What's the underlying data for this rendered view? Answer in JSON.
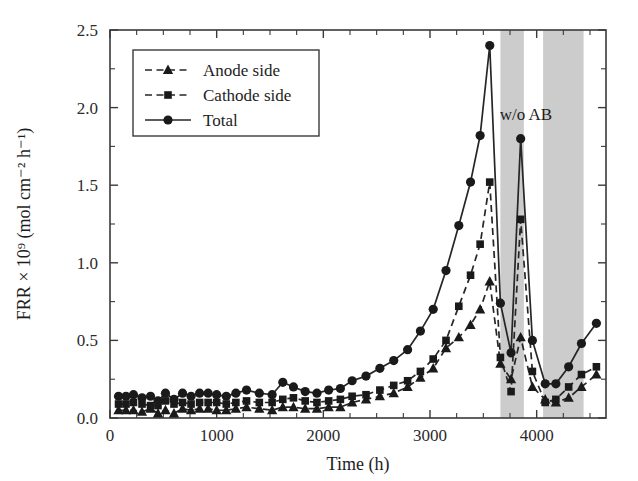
{
  "chart_data": {
    "type": "line",
    "title": "",
    "xlabel": "Time (h)",
    "ylabel": "FRR × 10⁹ (mol cm⁻² h⁻¹)",
    "xlim": [
      0,
      4650
    ],
    "ylim": [
      0.0,
      2.5
    ],
    "grid": false,
    "legend_position": "upper-left",
    "xticks": [
      0,
      1000,
      2000,
      3000,
      4000
    ],
    "xticklabels": [
      "0",
      "1000",
      "2000",
      "3000",
      "4000"
    ],
    "xticks_minor_step": 250,
    "yticks": [
      0.0,
      0.5,
      1.0,
      1.5,
      2.0,
      2.5
    ],
    "yticklabels": [
      "0.0",
      "0.5",
      "1.0",
      "1.5",
      "2.0",
      "2.5"
    ],
    "yticks_minor_step": 0.25,
    "annotations": [
      {
        "text": "w/o AB",
        "x": 3900,
        "y": 1.92
      }
    ],
    "shaded_bands": [
      {
        "x0": 3660,
        "x1": 3880,
        "color": "#c9c9c9"
      },
      {
        "x0": 4060,
        "x1": 4440,
        "color": "#c9c9c9"
      }
    ],
    "series": [
      {
        "name": "Anode side",
        "marker": "triangle",
        "linestyle": "dashed",
        "color": "#1a1a1a",
        "x": [
          80,
          150,
          220,
          300,
          380,
          450,
          520,
          600,
          680,
          760,
          840,
          920,
          1000,
          1090,
          1180,
          1280,
          1400,
          1520,
          1620,
          1720,
          1830,
          1940,
          2050,
          2160,
          2270,
          2400,
          2530,
          2660,
          2790,
          2910,
          3030,
          3150,
          3270,
          3380,
          3470,
          3560,
          3660,
          3760,
          3850,
          3960,
          4080,
          4180,
          4300,
          4420,
          4560
        ],
        "y": [
          0.05,
          0.05,
          0.05,
          0.04,
          0.06,
          0.03,
          0.05,
          0.03,
          0.06,
          0.05,
          0.06,
          0.06,
          0.05,
          0.05,
          0.06,
          0.07,
          0.06,
          0.05,
          0.07,
          0.07,
          0.06,
          0.06,
          0.07,
          0.07,
          0.1,
          0.12,
          0.14,
          0.16,
          0.2,
          0.26,
          0.32,
          0.45,
          0.52,
          0.6,
          0.7,
          0.88,
          0.35,
          0.25,
          0.52,
          0.2,
          0.12,
          0.1,
          0.13,
          0.2,
          0.28
        ]
      },
      {
        "name": "Cathode side",
        "marker": "square",
        "linestyle": "dashed",
        "color": "#1a1a1a",
        "x": [
          80,
          150,
          220,
          300,
          380,
          450,
          520,
          600,
          680,
          760,
          840,
          920,
          1000,
          1090,
          1180,
          1280,
          1400,
          1520,
          1620,
          1720,
          1830,
          1940,
          2050,
          2160,
          2270,
          2400,
          2530,
          2660,
          2790,
          2910,
          3030,
          3150,
          3270,
          3380,
          3470,
          3560,
          3660,
          3760,
          3850,
          3960,
          4080,
          4180,
          4300,
          4420,
          4560
        ],
        "y": [
          0.09,
          0.09,
          0.1,
          0.09,
          0.08,
          0.08,
          0.11,
          0.09,
          0.1,
          0.09,
          0.1,
          0.1,
          0.1,
          0.09,
          0.1,
          0.11,
          0.1,
          0.1,
          0.12,
          0.13,
          0.11,
          0.1,
          0.11,
          0.12,
          0.14,
          0.15,
          0.18,
          0.21,
          0.24,
          0.3,
          0.38,
          0.5,
          0.72,
          0.92,
          1.12,
          1.52,
          0.39,
          0.17,
          1.28,
          0.3,
          0.1,
          0.12,
          0.2,
          0.28,
          0.33
        ]
      },
      {
        "name": "Total",
        "marker": "circle",
        "linestyle": "solid",
        "color": "#1a1a1a",
        "x": [
          80,
          150,
          220,
          300,
          380,
          450,
          520,
          600,
          680,
          760,
          840,
          920,
          1000,
          1090,
          1180,
          1280,
          1400,
          1520,
          1620,
          1720,
          1830,
          1940,
          2050,
          2160,
          2270,
          2400,
          2530,
          2660,
          2790,
          2910,
          3030,
          3150,
          3270,
          3380,
          3470,
          3560,
          3660,
          3760,
          3850,
          3960,
          4080,
          4180,
          4300,
          4420,
          4560
        ],
        "y": [
          0.14,
          0.14,
          0.15,
          0.13,
          0.14,
          0.11,
          0.16,
          0.12,
          0.16,
          0.14,
          0.16,
          0.16,
          0.15,
          0.14,
          0.16,
          0.18,
          0.16,
          0.15,
          0.23,
          0.2,
          0.17,
          0.16,
          0.18,
          0.19,
          0.24,
          0.27,
          0.32,
          0.37,
          0.44,
          0.56,
          0.7,
          0.95,
          1.24,
          1.52,
          1.82,
          2.4,
          0.74,
          0.42,
          1.8,
          0.5,
          0.22,
          0.22,
          0.33,
          0.48,
          0.61
        ]
      }
    ]
  }
}
